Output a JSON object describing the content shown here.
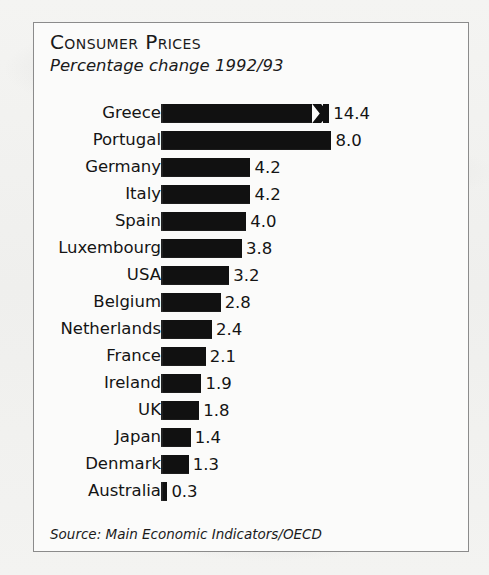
{
  "panel": {
    "title": "Consumer Prices",
    "subtitle": "Percentage change 1992/93",
    "source": "Source: Main Economic Indicators/OECD"
  },
  "chart_data": {
    "type": "bar",
    "orientation": "horizontal",
    "title": "Consumer Prices",
    "subtitle": "Percentage change 1992/93",
    "xlabel": "",
    "ylabel": "",
    "unit": "percent",
    "grid": false,
    "legend": null,
    "axis_break": {
      "series_category": "Greece",
      "note": "Greece bar is truncated with a zigzag scale-break symbol"
    },
    "xlim": [
      0,
      8.6
    ],
    "categories": [
      "Greece",
      "Portugal",
      "Germany",
      "Italy",
      "Spain",
      "Luxembourg",
      "USA",
      "Belgium",
      "Netherlands",
      "France",
      "Ireland",
      "UK",
      "Japan",
      "Denmark",
      "Australia"
    ],
    "values": [
      14.4,
      8.0,
      4.2,
      4.2,
      4.0,
      3.8,
      3.2,
      2.8,
      2.4,
      2.1,
      1.9,
      1.8,
      1.4,
      1.3,
      0.3
    ],
    "value_labels": [
      "14.4",
      "8.0",
      "4.2",
      "4.2",
      "4.0",
      "3.8",
      "3.2",
      "2.8",
      "2.4",
      "2.1",
      "1.9",
      "1.8",
      "1.4",
      "1.3",
      "0.3"
    ],
    "bars": [
      {
        "label": "Greece",
        "value": 14.4,
        "display": "14.4",
        "drawn_length": 7.9,
        "truncated": true
      },
      {
        "label": "Portugal",
        "value": 8.0,
        "display": "8.0",
        "drawn_length": 8.0,
        "truncated": false
      },
      {
        "label": "Germany",
        "value": 4.2,
        "display": "4.2",
        "drawn_length": 4.2,
        "truncated": false
      },
      {
        "label": "Italy",
        "value": 4.2,
        "display": "4.2",
        "drawn_length": 4.2,
        "truncated": false
      },
      {
        "label": "Spain",
        "value": 4.0,
        "display": "4.0",
        "drawn_length": 4.0,
        "truncated": false
      },
      {
        "label": "Luxembourg",
        "value": 3.8,
        "display": "3.8",
        "drawn_length": 3.8,
        "truncated": false
      },
      {
        "label": "USA",
        "value": 3.2,
        "display": "3.2",
        "drawn_length": 3.2,
        "truncated": false
      },
      {
        "label": "Belgium",
        "value": 2.8,
        "display": "2.8",
        "drawn_length": 2.8,
        "truncated": false
      },
      {
        "label": "Netherlands",
        "value": 2.4,
        "display": "2.4",
        "drawn_length": 2.4,
        "truncated": false
      },
      {
        "label": "France",
        "value": 2.1,
        "display": "2.1",
        "drawn_length": 2.1,
        "truncated": false
      },
      {
        "label": "Ireland",
        "value": 1.9,
        "display": "1.9",
        "drawn_length": 1.9,
        "truncated": false
      },
      {
        "label": "UK",
        "value": 1.8,
        "display": "1.8",
        "drawn_length": 1.8,
        "truncated": false
      },
      {
        "label": "Japan",
        "value": 1.4,
        "display": "1.4",
        "drawn_length": 1.4,
        "truncated": false
      },
      {
        "label": "Denmark",
        "value": 1.3,
        "display": "1.3",
        "drawn_length": 1.3,
        "truncated": false
      },
      {
        "label": "Australia",
        "value": 0.3,
        "display": "0.3",
        "drawn_length": 0.3,
        "truncated": false
      }
    ],
    "colors": {
      "bar": "#111111",
      "panel_background": "#fbfbfa",
      "page_background": "#f2f2f0",
      "frame": "#8b8b8b",
      "text": "#141414"
    },
    "source": "Source: Main Economic Indicators/OECD"
  }
}
